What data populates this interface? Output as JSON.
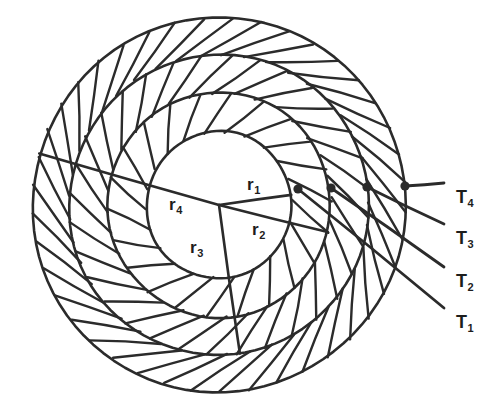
{
  "figure": {
    "background_color": "#ffffff",
    "ink_color": "#2b2b2b",
    "center": {
      "x": 219,
      "y": 205
    },
    "radius_labels": [
      {
        "name": "r1",
        "base": "r",
        "sub": "1",
        "x": 247,
        "y": 176,
        "angle_deg": -8,
        "radius_px": 73
      },
      {
        "name": "r2",
        "base": "r",
        "sub": "2",
        "x": 252,
        "y": 221,
        "angle_deg": 14,
        "radius_px": 112
      },
      {
        "name": "r3",
        "base": "r",
        "sub": "3",
        "x": 190,
        "y": 239,
        "angle_deg": 82,
        "radius_px": 150
      },
      {
        "name": "r4",
        "base": "r",
        "sub": "4",
        "x": 169,
        "y": 196,
        "angle_deg": 196,
        "radius_px": 187
      }
    ],
    "temperature_labels": [
      {
        "name": "T4",
        "base": "T",
        "sub": "4",
        "x": 456,
        "y": 188,
        "node_index": 3
      },
      {
        "name": "T3",
        "base": "T",
        "sub": "3",
        "x": 456,
        "y": 229,
        "node_index": 2
      },
      {
        "name": "T2",
        "base": "T",
        "sub": "2",
        "x": 456,
        "y": 272,
        "node_index": 1
      },
      {
        "name": "T1",
        "base": "T",
        "sub": "1",
        "x": 456,
        "y": 313,
        "node_index": 0
      }
    ],
    "nodes": [
      {
        "name": "node-T1",
        "x": 298,
        "y": 189
      },
      {
        "name": "node-T2",
        "x": 331,
        "y": 188
      },
      {
        "name": "node-T3",
        "x": 367,
        "y": 187
      },
      {
        "name": "node-T4",
        "x": 405,
        "y": 186
      }
    ],
    "rings": [
      {
        "name": "core",
        "r_inner": 0,
        "r_outer": 73,
        "hatched": false
      },
      {
        "name": "layer-1",
        "r_inner": 73,
        "r_outer": 112,
        "hatched": true
      },
      {
        "name": "layer-2",
        "r_inner": 112,
        "r_outer": 150,
        "hatched": true
      },
      {
        "name": "layer-3",
        "r_inner": 150,
        "r_outer": 187,
        "hatched": true
      }
    ]
  }
}
